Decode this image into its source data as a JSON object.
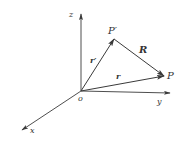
{
  "diagram": {
    "type": "3d-vector-diagram",
    "colors": {
      "line": "#3a3a3a",
      "text": "#333333",
      "background": "#ffffff"
    },
    "origin": {
      "label": "o",
      "x": 81,
      "y": 91
    },
    "axes": [
      {
        "name": "z",
        "label": "z",
        "end": [
          81,
          14
        ]
      },
      {
        "name": "x",
        "label": "x",
        "end": [
          22,
          130
        ]
      },
      {
        "name": "y",
        "label": "y",
        "end": [
          170,
          93
        ]
      }
    ],
    "points": [
      {
        "name": "P-prime",
        "label": "P′",
        "x": 114,
        "y": 39
      },
      {
        "name": "P",
        "label": "P",
        "x": 164,
        "y": 76
      }
    ],
    "vectors": [
      {
        "name": "r-prime",
        "label": "r′",
        "from": "o",
        "to": "P′"
      },
      {
        "name": "r",
        "label": "r",
        "from": "o",
        "to": "P"
      },
      {
        "name": "R",
        "label": "R",
        "from": "P′",
        "to": "P"
      }
    ]
  }
}
